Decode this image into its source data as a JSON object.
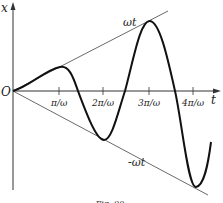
{
  "diagram": {
    "axis_y_label": "x",
    "axis_x_label": "t",
    "origin_label": "O",
    "upper_envelope_label": "ωt",
    "lower_envelope_label": "-ωt",
    "ticks": [
      "π/ω",
      "2π/ω",
      "3π/ω",
      "4π/ω"
    ],
    "caption": "Fig. 90"
  },
  "colors": {
    "curve": "#111111",
    "envelope": "#444444",
    "axis": "#333333"
  }
}
